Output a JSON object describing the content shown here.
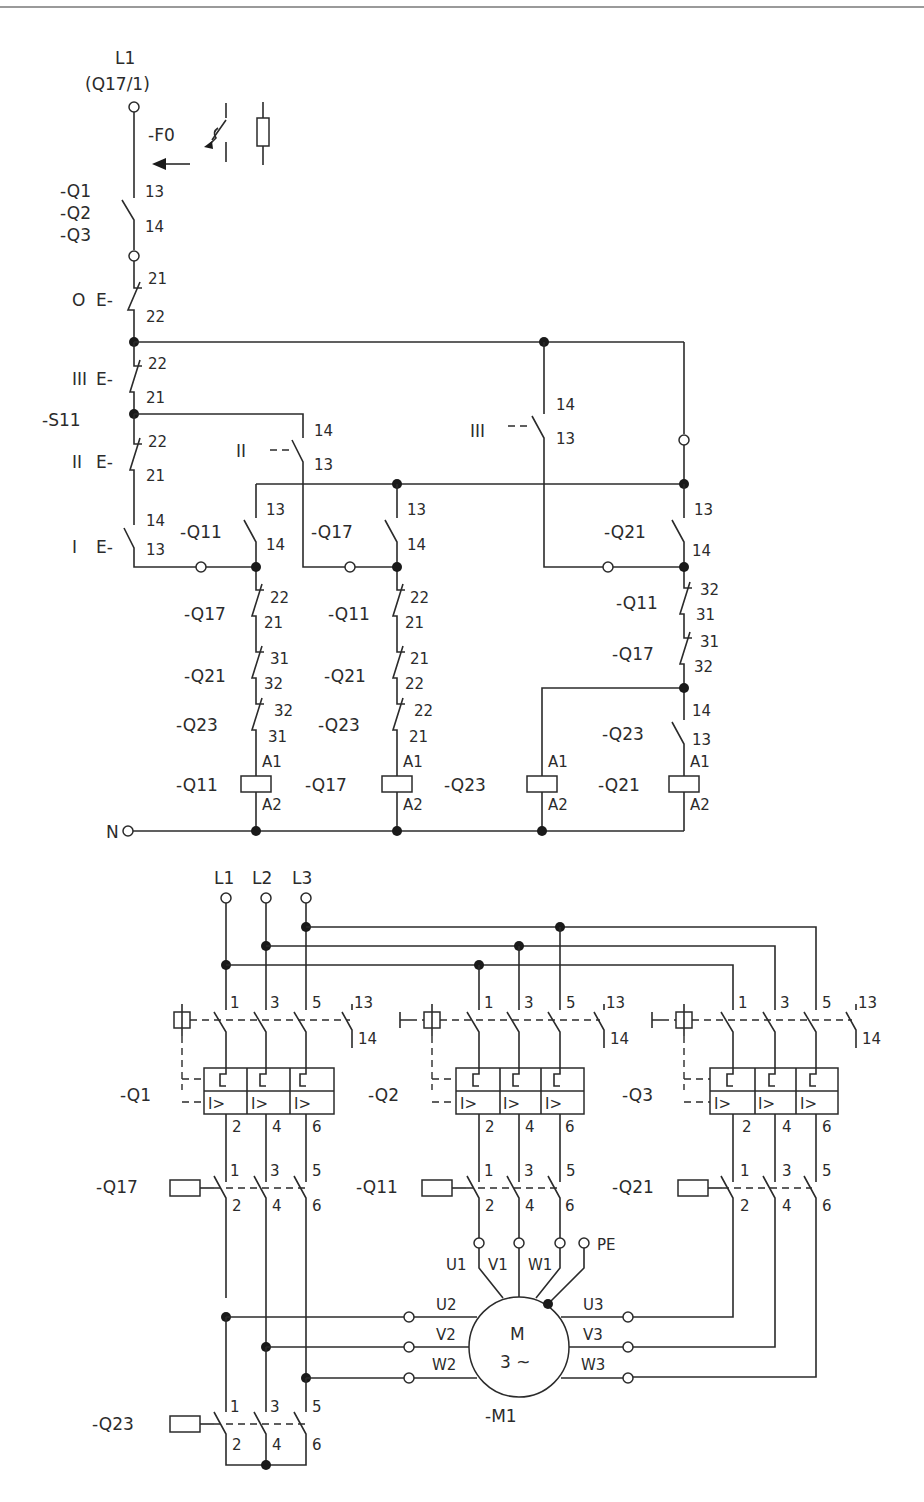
{
  "control_circuit": {
    "supply_top": "L1",
    "supply_ref": "(Q17/1)",
    "neutral": "N",
    "fuse": "-F0",
    "breaker_aux": {
      "devices": [
        "-Q1",
        "-Q2",
        "-Q3"
      ],
      "t1": "13",
      "t2": "14"
    },
    "switch_name": "-S11",
    "switch_positions": {
      "off": "O",
      "p1": "I",
      "p2": "II",
      "p3": "III"
    },
    "s11_contacts": [
      {
        "pos": "O",
        "t1": "21",
        "t2": "22"
      },
      {
        "pos": "III",
        "t1": "22",
        "t2": "21"
      },
      {
        "pos": "II",
        "t1": "22",
        "t2": "21"
      },
      {
        "pos": "I",
        "t1": "14",
        "t2": "13"
      },
      {
        "pos": "II",
        "t1": "14",
        "t2": "13"
      },
      {
        "pos": "III",
        "t1": "14",
        "t2": "13"
      }
    ],
    "branches": [
      {
        "hold": {
          "device": "-Q11",
          "t1": "13",
          "t2": "14"
        },
        "interlocks": [
          {
            "device": "-Q17",
            "t1": "22",
            "t2": "21"
          },
          {
            "device": "-Q21",
            "t1": "31",
            "t2": "32"
          },
          {
            "device": "-Q23",
            "t1": "32",
            "t2": "31"
          }
        ],
        "coil": {
          "device": "-Q11",
          "a1": "A1",
          "a2": "A2"
        }
      },
      {
        "hold": {
          "device": "-Q17",
          "t1": "13",
          "t2": "14"
        },
        "interlocks": [
          {
            "device": "-Q11",
            "t1": "22",
            "t2": "21"
          },
          {
            "device": "-Q21",
            "t1": "21",
            "t2": "22"
          },
          {
            "device": "-Q23",
            "t1": "22",
            "t2": "21"
          }
        ],
        "coil": {
          "device": "-Q17",
          "a1": "A1",
          "a2": "A2"
        }
      },
      {
        "coil": {
          "device": "-Q23",
          "a1": "A1",
          "a2": "A2"
        }
      },
      {
        "hold": {
          "device": "-Q21",
          "t1": "13",
          "t2": "14"
        },
        "interlocks": [
          {
            "device": "-Q11",
            "t1": "32",
            "t2": "31"
          },
          {
            "device": "-Q17",
            "t1": "31",
            "t2": "32"
          },
          {
            "device": "-Q23",
            "t1": "14",
            "t2": "13"
          }
        ],
        "coil": {
          "device": "-Q21",
          "a1": "A1",
          "a2": "A2"
        }
      }
    ]
  },
  "power_circuit": {
    "phases": [
      "L1",
      "L2",
      "L3"
    ],
    "breakers": [
      {
        "name": "-Q1",
        "in": [
          "1",
          "3",
          "5"
        ],
        "out": [
          "2",
          "4",
          "6"
        ],
        "aux": [
          "13",
          "14"
        ],
        "trip": "I>"
      },
      {
        "name": "-Q2",
        "in": [
          "1",
          "3",
          "5"
        ],
        "out": [
          "2",
          "4",
          "6"
        ],
        "aux": [
          "13",
          "14"
        ],
        "trip": "I>"
      },
      {
        "name": "-Q3",
        "in": [
          "1",
          "3",
          "5"
        ],
        "out": [
          "2",
          "4",
          "6"
        ],
        "aux": [
          "13",
          "14"
        ],
        "trip": "I>"
      }
    ],
    "contactors": [
      {
        "name": "-Q17",
        "in": [
          "1",
          "3",
          "5"
        ],
        "out": [
          "2",
          "4",
          "6"
        ]
      },
      {
        "name": "-Q11",
        "in": [
          "1",
          "3",
          "5"
        ],
        "out": [
          "2",
          "4",
          "6"
        ]
      },
      {
        "name": "-Q21",
        "in": [
          "1",
          "3",
          "5"
        ],
        "out": [
          "2",
          "4",
          "6"
        ]
      },
      {
        "name": "-Q23",
        "in": [
          "1",
          "3",
          "5"
        ],
        "out": [
          "2",
          "4",
          "6"
        ]
      }
    ],
    "motor": {
      "name": "-M1",
      "symbol": "M",
      "type": "3 ~",
      "terminals_top": [
        "U1",
        "V1",
        "W1",
        "PE"
      ],
      "terminals_left": [
        "U2",
        "V2",
        "W2"
      ],
      "terminals_right": [
        "U3",
        "V3",
        "W3"
      ]
    }
  }
}
